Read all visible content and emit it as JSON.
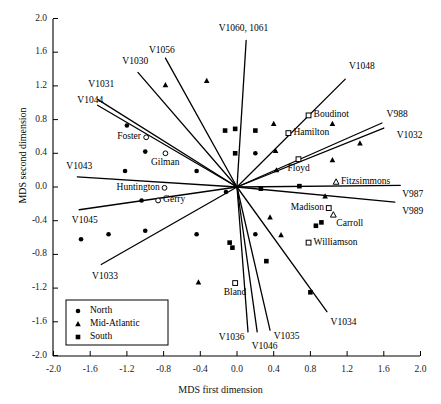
{
  "chart_data": {
    "type": "scatter",
    "title": "",
    "xlabel": "MDS first dimension",
    "ylabel": "MDS second dimension",
    "xlim": [
      -2.0,
      2.0
    ],
    "ylim": [
      -2.0,
      2.0
    ],
    "xticks": [
      "-2.0",
      "-1.6",
      "-1.2",
      "-0.8",
      "-0.4",
      "0.0",
      "0.4",
      "0.8",
      "1.2",
      "1.6",
      "2.0"
    ],
    "yticks": [
      "2.0",
      "1.6",
      "1.2",
      "0.8",
      "0.4",
      "0.0",
      "-0.4",
      "-0.8",
      "-1.2",
      "-1.6",
      "-2.0"
    ],
    "xtickvals": [
      -2.0,
      -1.6,
      -1.2,
      -0.8,
      -0.4,
      0.0,
      0.4,
      0.8,
      1.2,
      1.6,
      2.0
    ],
    "ytickvals": [
      2.0,
      1.6,
      1.2,
      0.8,
      0.4,
      0.0,
      -0.4,
      -0.8,
      -1.2,
      -1.6,
      -2.0
    ],
    "grid": false,
    "legend_position": "lower-left",
    "legend": [
      {
        "label": "North",
        "marker": "filled-circle"
      },
      {
        "label": "Mid-Atlantic",
        "marker": "filled-triangle"
      },
      {
        "label": "South",
        "marker": "filled-square"
      }
    ],
    "series": [
      {
        "name": "North",
        "marker": "filled-circle",
        "points": [
          {
            "x": -1.2,
            "y": 0.73
          },
          {
            "x": -1.0,
            "y": 0.42
          },
          {
            "x": -1.22,
            "y": 0.19
          },
          {
            "x": -0.44,
            "y": 0.19
          },
          {
            "x": 0.2,
            "y": 0.4
          },
          {
            "x": -0.12,
            "y": -0.06
          },
          {
            "x": -1.7,
            "y": -0.62
          },
          {
            "x": -1.4,
            "y": -0.56
          },
          {
            "x": -1.0,
            "y": -0.52
          },
          {
            "x": -0.44,
            "y": -0.56
          },
          {
            "x": -1.04,
            "y": -0.16
          },
          {
            "x": 0.2,
            "y": -0.56
          }
        ]
      },
      {
        "name": "Mid-Atlantic",
        "marker": "filled-triangle",
        "points": [
          {
            "x": -0.78,
            "y": 1.21
          },
          {
            "x": -0.33,
            "y": 1.26
          },
          {
            "x": 0.4,
            "y": 0.75
          },
          {
            "x": 0.42,
            "y": 0.43
          },
          {
            "x": 1.04,
            "y": 0.75
          },
          {
            "x": 1.34,
            "y": 0.52
          },
          {
            "x": 1.04,
            "y": 0.32
          },
          {
            "x": 0.43,
            "y": 0.2
          },
          {
            "x": 0.96,
            "y": -0.11
          },
          {
            "x": 0.36,
            "y": -0.36
          },
          {
            "x": 0.48,
            "y": -0.57
          },
          {
            "x": -0.42,
            "y": -1.13
          }
        ]
      },
      {
        "name": "South",
        "marker": "filled-square",
        "points": [
          {
            "x": -0.02,
            "y": 0.69
          },
          {
            "x": 0.2,
            "y": 0.67
          },
          {
            "x": -0.13,
            "y": 0.67
          },
          {
            "x": 0.26,
            "y": -0.02
          },
          {
            "x": 0.68,
            "y": 0.01
          },
          {
            "x": -0.08,
            "y": -0.66
          },
          {
            "x": -0.05,
            "y": -0.72
          },
          {
            "x": 0.86,
            "y": -0.46
          },
          {
            "x": 0.92,
            "y": -0.42
          },
          {
            "x": 0.32,
            "y": -0.88
          },
          {
            "x": 0.8,
            "y": -1.25
          },
          {
            "x": -0.02,
            "y": 0.4
          }
        ]
      }
    ],
    "named_points": [
      {
        "label": "Foster",
        "x": -0.99,
        "y": 0.59,
        "marker": "open-circle",
        "label_side": "left"
      },
      {
        "label": "Gilman",
        "x": -0.78,
        "y": 0.4,
        "marker": "open-circle",
        "label_side": "below"
      },
      {
        "label": "Huntington",
        "x": -0.79,
        "y": -0.01,
        "marker": "open-circle",
        "label_side": "left"
      },
      {
        "label": "Gerry",
        "x": -0.86,
        "y": -0.16,
        "marker": "open-circle",
        "label_side": "right"
      },
      {
        "label": "Boudinot",
        "x": 0.78,
        "y": 0.85,
        "marker": "open-square",
        "label_side": "right"
      },
      {
        "label": "Hamilton",
        "x": 0.56,
        "y": 0.64,
        "marker": "open-square",
        "label_side": "right"
      },
      {
        "label": "Floyd",
        "x": 0.67,
        "y": 0.33,
        "marker": "open-square",
        "label_side": "below"
      },
      {
        "label": "Fitzsimmons",
        "x": 1.08,
        "y": 0.06,
        "marker": "open-triangle",
        "label_side": "right"
      },
      {
        "label": "Madison",
        "x": 1.0,
        "y": -0.25,
        "marker": "open-square",
        "label_side": "left"
      },
      {
        "label": "Carroll",
        "x": 1.05,
        "y": -0.33,
        "marker": "open-triangle",
        "label_side": "below-right"
      },
      {
        "label": "Williamson",
        "x": 0.78,
        "y": -0.66,
        "marker": "open-square",
        "label_side": "right"
      },
      {
        "label": "Bland",
        "x": -0.02,
        "y": -1.14,
        "marker": "open-square",
        "label_side": "below"
      }
    ],
    "vectors": [
      {
        "label": "V1031",
        "x": -1.52,
        "y": 1.04,
        "label_x": -1.62,
        "label_y": 1.21,
        "anchor": "start"
      },
      {
        "label": "V1044",
        "x": -1.52,
        "y": 0.97,
        "label_x": -1.74,
        "label_y": 1.02,
        "anchor": "start"
      },
      {
        "label": "V1030",
        "x": -1.08,
        "y": 1.36,
        "label_x": -1.25,
        "label_y": 1.48,
        "anchor": "start"
      },
      {
        "label": "V1056",
        "x": -0.78,
        "y": 1.53,
        "label_x": -0.96,
        "label_y": 1.62,
        "anchor": "start"
      },
      {
        "label": "V1060, 1061",
        "x": 0.1,
        "y": 1.74,
        "label_x": -0.2,
        "label_y": 1.87,
        "anchor": "start"
      },
      {
        "label": "V1048",
        "x": 1.18,
        "y": 1.28,
        "label_x": 1.22,
        "label_y": 1.43,
        "anchor": "start"
      },
      {
        "label": "V988",
        "x": 1.58,
        "y": 0.76,
        "label_x": 1.63,
        "label_y": 0.86,
        "anchor": "start"
      },
      {
        "label": "V1032",
        "x": 1.6,
        "y": 0.7,
        "label_x": 1.74,
        "label_y": 0.6,
        "anchor": "start"
      },
      {
        "label": "V987",
        "x": 1.78,
        "y": 0.02,
        "label_x": 1.8,
        "label_y": -0.09,
        "anchor": "start"
      },
      {
        "label": "V989",
        "x": 1.72,
        "y": -0.18,
        "label_x": 1.8,
        "label_y": -0.3,
        "anchor": "start"
      },
      {
        "label": "V1034",
        "x": 0.98,
        "y": -1.48,
        "label_x": 1.02,
        "label_y": -1.62,
        "anchor": "start"
      },
      {
        "label": "V1035",
        "x": 0.36,
        "y": -1.7,
        "label_x": 0.4,
        "label_y": -1.78,
        "anchor": "start"
      },
      {
        "label": "V1046",
        "x": 0.22,
        "y": -1.72,
        "label_x": 0.16,
        "label_y": -1.9,
        "anchor": "start"
      },
      {
        "label": "V1036",
        "x": 0.12,
        "y": -1.72,
        "label_x": -0.2,
        "label_y": -1.79,
        "anchor": "start"
      },
      {
        "label": "V1033",
        "x": -1.48,
        "y": -0.92,
        "label_x": -1.58,
        "label_y": -1.07,
        "anchor": "start"
      },
      {
        "label": "V1045",
        "x": -1.72,
        "y": -0.27,
        "label_x": -1.8,
        "label_y": -0.4,
        "anchor": "start"
      },
      {
        "label": "V1043",
        "x": -1.74,
        "y": 0.12,
        "label_x": -1.86,
        "label_y": 0.24,
        "anchor": "start"
      }
    ]
  },
  "colors": {
    "ink": "#000000",
    "background": "#ffffff",
    "tick_text": "#1a1a1a"
  }
}
